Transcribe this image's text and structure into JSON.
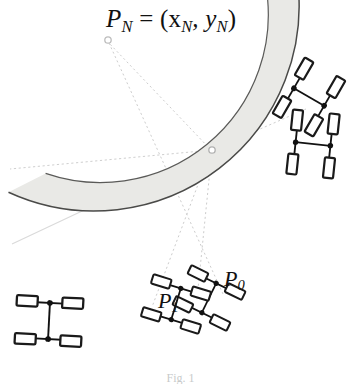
{
  "figure": {
    "kind": "technical-line-drawing",
    "background_color": "#ffffff",
    "title_label": "P",
    "title_sub": "N",
    "title_eq": " = (x",
    "title_sub2": "N",
    "title_comma": ", y",
    "title_sub3": "N",
    "title_close": ")",
    "title_full": "P_N = (x_N, y_N)",
    "caption": "Fig. 1",
    "band": {
      "name": "curved-road-band",
      "fill_color": "#e9e9e6",
      "stroke_color": "#4a4a48",
      "center_x": 212,
      "center_y": 150,
      "inner_radius": 168,
      "outer_radius": 205,
      "start_angle_deg": 172,
      "end_angle_deg": 289
    },
    "pivot_marker": {
      "name": "rotation-center-marker",
      "x": 212,
      "y": 150,
      "radius": 3.2,
      "stroke_color": "#b9b9b9"
    },
    "outer_marker": {
      "name": "point-pn-marker",
      "x": 108,
      "y": 40,
      "radius": 3.2,
      "stroke_color": "#c2c2c2"
    },
    "guide_lines": [
      {
        "name": "radial-guide-to-pn",
        "x1": 212,
        "y1": 150,
        "x2": 108,
        "y2": 40,
        "style": "dotted",
        "color": "#c9c9c9"
      },
      {
        "name": "horizontal-guide-left",
        "x1": 212,
        "y1": 150,
        "x2": 14,
        "y2": 168,
        "style": "dotted",
        "color": "#c9c9c9"
      },
      {
        "name": "radial-guide-to-p1",
        "x1": 212,
        "y1": 150,
        "x2": 150,
        "y2": 308,
        "style": "dotted",
        "color": "#c9c9c9"
      },
      {
        "name": "radial-guide-to-p0",
        "x1": 212,
        "y1": 150,
        "x2": 196,
        "y2": 300,
        "style": "dotted",
        "color": "#c9c9c9"
      },
      {
        "name": "chord-guide-upper-right",
        "x1": 212,
        "y1": 150,
        "x2": 300,
        "y2": 112,
        "style": "dotted",
        "color": "#c9c9c9"
      },
      {
        "name": "chord-guide-lower-left",
        "x1": 212,
        "y1": 150,
        "x2": 14,
        "y2": 243,
        "style": "solid",
        "color": "#d6d6d6"
      },
      {
        "name": "tangent-guide-long",
        "x1": 108,
        "y1": 40,
        "x2": 222,
        "y2": 292,
        "style": "dotted",
        "color": "#c9c9c9"
      }
    ],
    "vehicles": [
      {
        "name": "vehicle-pn-top",
        "cx": 308,
        "cy": 97,
        "angle_deg": -62,
        "label": ""
      },
      {
        "name": "vehicle-upper-right",
        "cx": 312,
        "cy": 143,
        "angle_deg": -84,
        "label": ""
      },
      {
        "name": "vehicle-p0",
        "cx": 208,
        "cy": 299,
        "angle_deg": -156,
        "label": "P_0"
      },
      {
        "name": "vehicle-p1",
        "cx": 175,
        "cy": 305,
        "angle_deg": -164,
        "label": "P_1"
      },
      {
        "name": "vehicle-left-end",
        "cx": 48,
        "cy": 321,
        "angle_deg": -178,
        "label": ""
      }
    ],
    "vehicle_geometry": {
      "wheel_width": 22,
      "wheel_height": 11,
      "wheel_fill": "#ffffff",
      "wheel_stroke": "#1a1a1a",
      "wheel_stroke_width": 2.4,
      "track_half": 24,
      "wheelbase_half": 19,
      "hub_radius": 3,
      "hub_color": "#111111",
      "axle_color": "#111111",
      "axle_width": 2
    },
    "labels": {
      "p0": {
        "base": "P",
        "sub": "0",
        "x": 224,
        "y": 268
      },
      "p1": {
        "base": "P",
        "sub": "1",
        "x": 158,
        "y": 290
      }
    }
  }
}
